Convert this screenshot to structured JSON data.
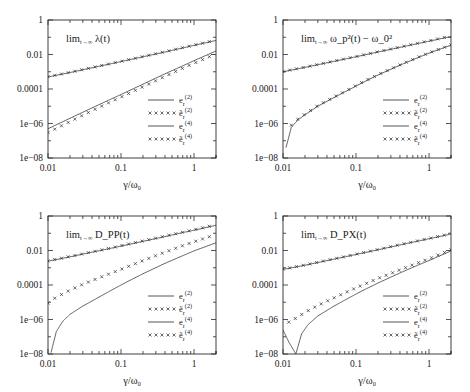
{
  "figure": {
    "name": "four-panel-loglog-figure",
    "background": "#ffffff",
    "line_color": "#1a1a1a",
    "rows": 2,
    "cols": 2
  },
  "axes": {
    "x": {
      "label_parts": {
        "num": "γ",
        "den": "ω",
        "den_sub": "0"
      },
      "label": "γ/ω₀",
      "scale": "log",
      "min": 0.01,
      "max": 2,
      "ticks": [
        0.01,
        0.1,
        1
      ],
      "tick_labels": [
        "0.01",
        "0.1",
        "1"
      ]
    },
    "y": {
      "label": "",
      "scale": "log",
      "min": 1e-08,
      "max": 1,
      "ticks": [
        1,
        0.01,
        0.0001,
        1e-06,
        1e-08
      ],
      "tick_labels": [
        "1",
        "0.01",
        "0.0001",
        "1e−06",
        "1e−08"
      ]
    }
  },
  "legend": {
    "position": "bottom-right-inside",
    "entries": [
      {
        "style": "line",
        "base": "e",
        "sub": "r",
        "sup": "(2)",
        "tilde": false,
        "label": "e_r^(2)"
      },
      {
        "style": "points",
        "base": "e",
        "sub": "r",
        "sup": "(2)",
        "tilde": true,
        "label": "ẽ_r^(2)"
      },
      {
        "style": "line",
        "base": "e",
        "sub": "r",
        "sup": "(4)",
        "tilde": false,
        "label": "e_r^(4)"
      },
      {
        "style": "points",
        "base": "e",
        "sub": "r",
        "sup": "(4)",
        "tilde": true,
        "label": "ẽ_r^(4)"
      }
    ]
  },
  "chart_data": [
    {
      "id": "panel-lambda",
      "type": "line",
      "position": "top-left",
      "title": "lim_{t→∞} λ(t)",
      "title_parts": {
        "lim": "lim",
        "limsub": "t→∞",
        "expr": "λ(t)"
      },
      "xlabel": "γ/ω₀",
      "ylabel": "",
      "xscale": "log",
      "yscale": "log",
      "xlim": [
        0.01,
        2
      ],
      "ylim": [
        1e-08,
        1
      ],
      "grid": false,
      "series": [
        {
          "name": "e_r^(2)",
          "style": "line",
          "x": [
            0.01,
            0.02,
            0.04,
            0.07,
            0.1,
            0.2,
            0.4,
            0.7,
            1.0,
            2.0
          ],
          "y": [
            0.0005,
            0.0009,
            0.0017,
            0.0028,
            0.0039,
            0.0074,
            0.014,
            0.024,
            0.034,
            0.065
          ]
        },
        {
          "name": "e~_r^(2)",
          "style": "points",
          "x": [
            0.01,
            0.02,
            0.04,
            0.07,
            0.1,
            0.2,
            0.4,
            0.7,
            1.0,
            2.0
          ],
          "y": [
            0.00052,
            0.00093,
            0.00175,
            0.0029,
            0.004,
            0.0076,
            0.0145,
            0.025,
            0.035,
            0.068
          ]
        },
        {
          "name": "e_r^(4)",
          "style": "line",
          "x": [
            0.01,
            0.02,
            0.04,
            0.07,
            0.1,
            0.2,
            0.4,
            0.7,
            1.0,
            2.0
          ],
          "y": [
            5e-07,
            2e-06,
            8e-06,
            2.4e-05,
            4.8e-05,
            0.00019,
            0.00076,
            0.0022,
            0.0044,
            0.016
          ]
        },
        {
          "name": "e~_r^(4)",
          "style": "points",
          "x": [
            0.01,
            0.02,
            0.04,
            0.07,
            0.1,
            0.2,
            0.4,
            0.7,
            1.0,
            2.0
          ],
          "y": [
            3e-07,
            1.3e-06,
            5.5e-06,
            1.7e-05,
            3.4e-05,
            0.000135,
            0.00054,
            0.0016,
            0.0031,
            0.011
          ]
        }
      ]
    },
    {
      "id": "panel-omega",
      "type": "line",
      "position": "top-right",
      "title": "lim_{t→∞} ω_p^2(t) − ω_0^2",
      "title_parts": {
        "lim": "lim",
        "limsub": "t→∞",
        "expr": "ω_p²(t) − ω_0²"
      },
      "xlabel": "γ/ω₀",
      "ylabel": "",
      "xscale": "log",
      "yscale": "log",
      "xlim": [
        0.01,
        2
      ],
      "ylim": [
        1e-08,
        1
      ],
      "grid": false,
      "series": [
        {
          "name": "e_r^(2)",
          "style": "line",
          "x": [
            0.01,
            0.02,
            0.04,
            0.07,
            0.1,
            0.2,
            0.4,
            0.7,
            1.0,
            2.0
          ],
          "y": [
            0.001,
            0.0018,
            0.0033,
            0.0054,
            0.0074,
            0.014,
            0.026,
            0.043,
            0.059,
            0.11
          ]
        },
        {
          "name": "e~_r^(2)",
          "style": "points",
          "x": [
            0.01,
            0.02,
            0.04,
            0.07,
            0.1,
            0.2,
            0.4,
            0.7,
            1.0,
            2.0
          ],
          "y": [
            0.00105,
            0.00185,
            0.0034,
            0.0056,
            0.0076,
            0.0145,
            0.027,
            0.045,
            0.062,
            0.12
          ]
        },
        {
          "name": "e_r^(4)",
          "style": "line",
          "x": [
            0.011,
            0.013,
            0.016,
            0.02,
            0.03,
            0.05,
            0.08,
            0.12,
            0.2,
            0.4,
            0.7,
            1.0,
            2.0
          ],
          "y": [
            4e-08,
            6e-07,
            1.6e-06,
            3.2e-06,
            1e-05,
            3.2e-05,
            9e-05,
            0.00022,
            0.00065,
            0.0024,
            0.0065,
            0.012,
            0.035
          ],
          "note": "sharp dip (zero crossing) near x=0.011"
        },
        {
          "name": "e~_r^(4)",
          "style": "points",
          "x": [
            0.013,
            0.016,
            0.02,
            0.03,
            0.05,
            0.08,
            0.12,
            0.2,
            0.4,
            0.7,
            1.0,
            2.0
          ],
          "y": [
            8e-07,
            1.8e-06,
            3.5e-06,
            1.1e-05,
            3.4e-05,
            9.5e-05,
            0.00024,
            0.00068,
            0.0025,
            0.0068,
            0.0125,
            0.036
          ]
        }
      ]
    },
    {
      "id": "panel-dpp",
      "type": "line",
      "position": "bottom-left",
      "title": "lim_{t→∞} D_PP(t)",
      "title_parts": {
        "lim": "lim",
        "limsub": "t→∞",
        "expr": "D_PP(t)"
      },
      "xlabel": "γ/ω₀",
      "ylabel": "",
      "xscale": "log",
      "yscale": "log",
      "xlim": [
        0.01,
        2
      ],
      "ylim": [
        1e-08,
        1
      ],
      "grid": false,
      "series": [
        {
          "name": "e_r^(2)",
          "style": "line",
          "x": [
            0.01,
            0.02,
            0.04,
            0.07,
            0.1,
            0.2,
            0.4,
            0.7,
            1.0,
            2.0
          ],
          "y": [
            0.0024,
            0.0043,
            0.008,
            0.013,
            0.018,
            0.034,
            0.064,
            0.11,
            0.15,
            0.29
          ]
        },
        {
          "name": "e~_r^(2)",
          "style": "points",
          "x": [
            0.01,
            0.02,
            0.04,
            0.07,
            0.1,
            0.2,
            0.4,
            0.7,
            1.0,
            2.0
          ],
          "y": [
            0.0025,
            0.0045,
            0.0083,
            0.0135,
            0.019,
            0.036,
            0.068,
            0.115,
            0.16,
            0.31
          ]
        },
        {
          "name": "e_r^(4)",
          "style": "line",
          "x": [
            0.011,
            0.013,
            0.016,
            0.02,
            0.03,
            0.05,
            0.08,
            0.12,
            0.2,
            0.4,
            0.7,
            1.0,
            2.0
          ],
          "y": [
            1.2e-08,
            2e-07,
            8e-07,
            2e-06,
            6e-06,
            2e-05,
            6e-05,
            0.00015,
            0.00045,
            0.0018,
            0.005,
            0.0095,
            0.028
          ],
          "note": "sharp dip (zero crossing) near x=0.011"
        },
        {
          "name": "e~_r^(4)",
          "style": "points",
          "x": [
            0.01,
            0.013,
            0.02,
            0.03,
            0.05,
            0.08,
            0.12,
            0.2,
            0.4,
            0.7,
            1.0,
            2.0
          ],
          "y": [
            9e-06,
            2e-05,
            5e-05,
            0.00011,
            0.00026,
            0.00056,
            0.0011,
            0.0026,
            0.008,
            0.019,
            0.032,
            0.085
          ]
        }
      ]
    },
    {
      "id": "panel-dpx",
      "type": "line",
      "position": "bottom-right",
      "title": "lim_{t→∞} D_PX(t)",
      "title_parts": {
        "lim": "lim",
        "limsub": "t→∞",
        "expr": "D_PX(t)"
      },
      "xlabel": "γ/ω₀",
      "ylabel": "",
      "xscale": "log",
      "yscale": "log",
      "xlim": [
        0.01,
        2
      ],
      "ylim": [
        1e-08,
        1
      ],
      "grid": false,
      "series": [
        {
          "name": "e_r^(2)",
          "style": "line",
          "x": [
            0.01,
            0.02,
            0.04,
            0.07,
            0.1,
            0.2,
            0.4,
            0.7,
            1.0,
            2.0
          ],
          "y": [
            0.0008,
            0.0014,
            0.0026,
            0.0043,
            0.0059,
            0.011,
            0.021,
            0.035,
            0.048,
            0.09
          ]
        },
        {
          "name": "e~_r^(2)",
          "style": "points",
          "x": [
            0.01,
            0.02,
            0.04,
            0.07,
            0.1,
            0.2,
            0.4,
            0.7,
            1.0,
            2.0
          ],
          "y": [
            0.00083,
            0.00145,
            0.0027,
            0.0044,
            0.0061,
            0.0115,
            0.022,
            0.036,
            0.05,
            0.095
          ]
        },
        {
          "name": "e_r^(4)",
          "style": "line",
          "x": [
            0.01,
            0.012,
            0.015,
            0.018,
            0.022,
            0.03,
            0.05,
            0.08,
            0.12,
            0.2,
            0.4,
            0.7,
            1.0,
            2.0
          ],
          "y": [
            2.5e-07,
            5e-08,
            1e-08,
            1.5e-07,
            5e-07,
            1.6e-06,
            6e-06,
            1.8e-05,
            4.5e-05,
            0.00013,
            0.0005,
            0.0014,
            0.0026,
            0.0095
          ],
          "note": "V-shaped zero crossing near x=0.015"
        },
        {
          "name": "e~_r^(4)",
          "style": "points",
          "x": [
            0.012,
            0.016,
            0.02,
            0.03,
            0.05,
            0.08,
            0.12,
            0.2,
            0.4,
            0.7,
            1.0,
            2.0
          ],
          "y": [
            7e-07,
            1.4e-06,
            2.6e-06,
            6.5e-06,
            1.8e-05,
            4.5e-05,
            9.5e-05,
            0.00024,
            0.00075,
            0.0019,
            0.0033,
            0.011
          ]
        }
      ]
    }
  ]
}
